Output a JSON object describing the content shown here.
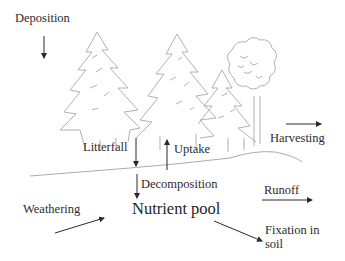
{
  "diagram": {
    "title": "",
    "center_node": {
      "label": "Nutrient pool"
    },
    "flows": [
      {
        "id": "deposition",
        "label": "Deposition",
        "direction": "down"
      },
      {
        "id": "litterfall",
        "label": "Litterfall",
        "direction": "down"
      },
      {
        "id": "uptake",
        "label": "Uptake",
        "direction": "up"
      },
      {
        "id": "harvesting",
        "label": "Harvesting",
        "direction": "right"
      },
      {
        "id": "decomposition",
        "label": "Decomposition",
        "direction": "down"
      },
      {
        "id": "runoff",
        "label": "Runoff",
        "direction": "right"
      },
      {
        "id": "weathering",
        "label": "Weathering",
        "direction": "up-right"
      },
      {
        "id": "fixation",
        "label": "Fixation in soil",
        "direction": "down-right"
      }
    ],
    "illustration": {
      "elements": [
        "conifer-tree",
        "conifer-tree",
        "conifer-tree",
        "deciduous-tree",
        "ground-line"
      ]
    },
    "colors": {
      "line": "#2a2a2a",
      "sketch": "#9a9a9a",
      "background": "#ffffff"
    }
  }
}
